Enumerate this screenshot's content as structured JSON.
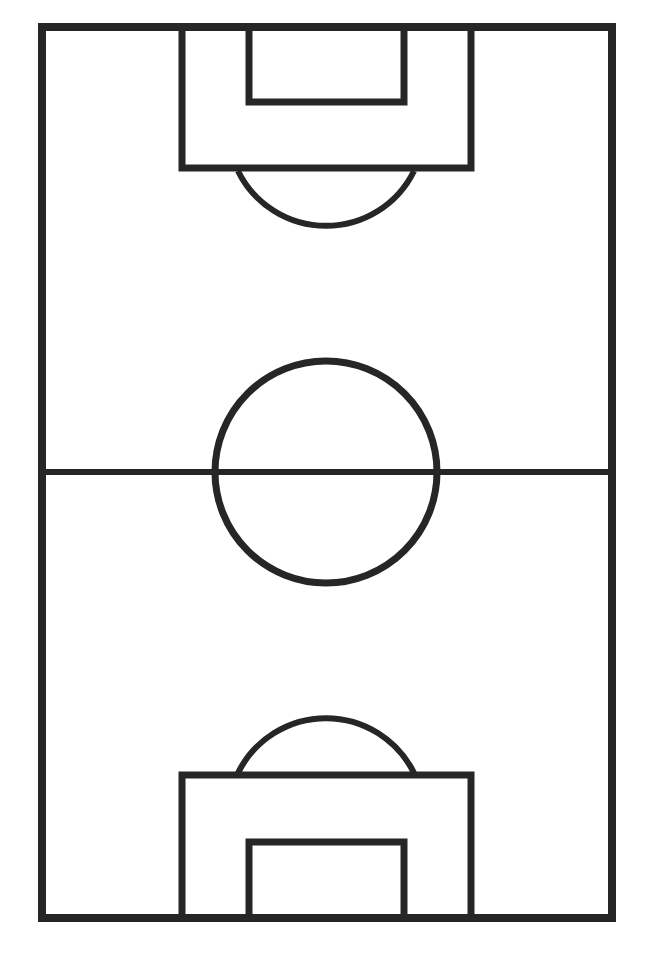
{
  "diagram": {
    "colors": {
      "background": "#ffffff",
      "line": "#262626"
    },
    "field": {
      "x": 42,
      "y": 27,
      "width": 570,
      "height": 891,
      "stroke": 8
    },
    "halfway_line": {
      "y": 472
    },
    "center_circle": {
      "cx": 326,
      "cy": 472,
      "r": 111
    },
    "top_penalty_box": {
      "x": 182,
      "y": 27,
      "width": 289,
      "height": 141
    },
    "top_goal_box": {
      "x": 249,
      "y": 27,
      "width": 155,
      "height": 75
    },
    "bottom_penalty_box": {
      "x": 182,
      "y": 775,
      "width": 289,
      "height": 143
    },
    "bottom_goal_box": {
      "x": 249,
      "y": 842,
      "width": 155,
      "height": 76
    }
  }
}
